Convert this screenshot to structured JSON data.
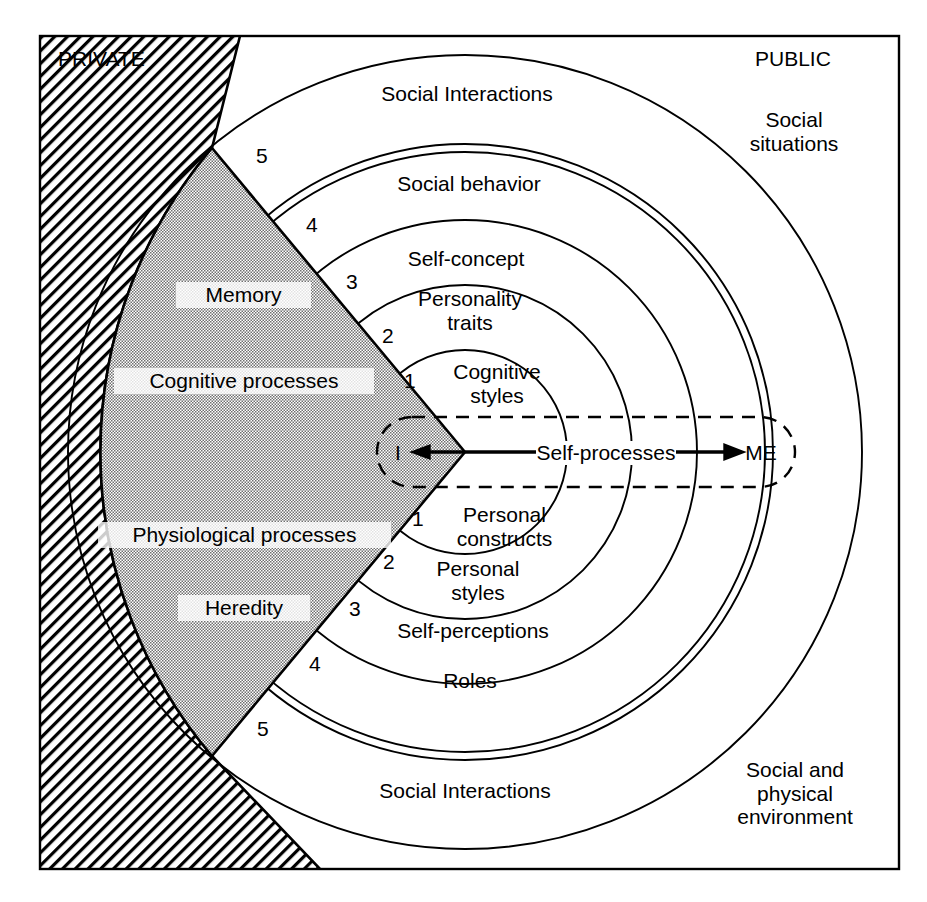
{
  "diagram": {
    "title_private": "PRIVATE",
    "title_public": "PUBLIC",
    "center_axis": {
      "cx": 465,
      "cy": 452
    },
    "corner_labels": [
      {
        "name": "private",
        "text": "PRIVATE",
        "x": 58,
        "y": 47
      },
      {
        "name": "public",
        "text": "PUBLIC",
        "x": 793,
        "y": 47
      },
      {
        "name": "social-situations",
        "text": "Social\nsituations",
        "x": 793,
        "y": 130
      },
      {
        "name": "social-physical-environment",
        "text": "Social and\nphysical\nenvironment",
        "x": 793,
        "y": 768
      }
    ],
    "core_region": {
      "name": "private-self",
      "labels": [
        {
          "text": "Memory",
          "x": 236,
          "y": 293
        },
        {
          "text": "Cognitive processes",
          "x": 236,
          "y": 379
        },
        {
          "text": "Physiological processes",
          "x": 236,
          "y": 533
        },
        {
          "text": "Heredity",
          "x": 236,
          "y": 606
        }
      ]
    },
    "self_axis": {
      "inner_label": "I",
      "outer_label": "ME",
      "process_label": "Self-processes",
      "inner_x": 398,
      "outer_x": 761,
      "y": 452
    },
    "upper_rings": [
      {
        "n": "1",
        "label": "Cognitive\nstyles",
        "label_x": 497,
        "label_y": 372,
        "num_x": 410,
        "num_y": 380
      },
      {
        "n": "2",
        "label": "Personality\ntraits",
        "label_x": 470,
        "label_y": 309,
        "num_x": 388,
        "num_y": 335
      },
      {
        "n": "3",
        "label": "Self-concept",
        "label_x": 466,
        "label_y": 258,
        "num_x": 352,
        "num_y": 281
      },
      {
        "n": "4",
        "label": "Social behavior",
        "label_x": 469,
        "label_y": 183,
        "num_x": 312,
        "num_y": 224
      },
      {
        "n": "5",
        "label": "Social Interactions",
        "label_x": 467,
        "label_y": 93,
        "num_x": 262,
        "num_y": 155
      }
    ],
    "lower_rings": [
      {
        "n": "1",
        "label": "Personal\nconstructs",
        "label_x": 502,
        "label_y": 515,
        "num_x": 418,
        "num_y": 518
      },
      {
        "n": "2",
        "label": "Personal\nstyles",
        "label_x": 478,
        "label_y": 569,
        "num_x": 389,
        "num_y": 561
      },
      {
        "n": "3",
        "label": "Self-perceptions",
        "label_x": 473,
        "label_y": 630,
        "num_x": 355,
        "num_y": 608
      },
      {
        "n": "4",
        "label": "Roles",
        "label_x": 470,
        "label_y": 680,
        "num_x": 315,
        "num_y": 663
      },
      {
        "n": "5",
        "label": "Social Interactions",
        "label_x": 465,
        "label_y": 790,
        "num_x": 263,
        "num_y": 728
      }
    ],
    "colors": {
      "stroke": "#000000",
      "core_fill": "#c9c9c9",
      "hatch": "#000000",
      "background": "#ffffff",
      "label_bg": "#ffffff"
    },
    "ring_radii": [
      102,
      167,
      232,
      305,
      397
    ],
    "frame": {
      "x": 39,
      "y": 35,
      "w": 861,
      "h": 835
    }
  }
}
